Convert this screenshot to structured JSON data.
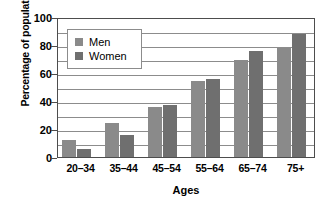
{
  "chart_data": {
    "type": "bar",
    "title": "",
    "xlabel": "Ages",
    "ylabel": "Percentage of population",
    "categories": [
      "20–34",
      "35–44",
      "45–54",
      "55–64",
      "65–74",
      "75+"
    ],
    "series": [
      {
        "name": "Men",
        "color": "#8a8a8a",
        "values": [
          12,
          24,
          36,
          54,
          69,
          78
        ]
      },
      {
        "name": "Women",
        "color": "#6f6f6f",
        "values": [
          6,
          16,
          37,
          56,
          76,
          88
        ]
      }
    ],
    "ylim": [
      0,
      100
    ],
    "y_ticks": [
      0,
      20,
      40,
      60,
      80,
      100
    ],
    "y_tick_labels": [
      "0",
      "20",
      "40",
      "60",
      "80",
      "100"
    ],
    "gridlines": [
      10,
      20,
      30,
      40,
      50,
      60,
      70,
      80,
      90
    ],
    "grid": true,
    "legend_position": "upper-left-inside",
    "legend_entries": [
      "Men",
      "Women"
    ]
  }
}
